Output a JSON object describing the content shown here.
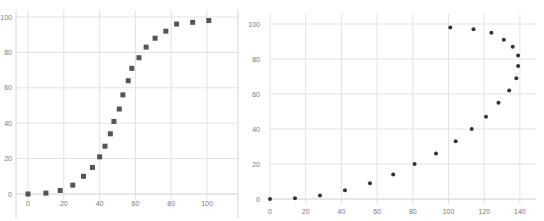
{
  "chart_data": [
    {
      "type": "scatter",
      "title": "",
      "xlabel": "",
      "ylabel": "",
      "xlim": [
        0,
        115
      ],
      "ylim": [
        0,
        105
      ],
      "x_ticks": [
        "0",
        "20",
        "40",
        "60",
        "80",
        "100"
      ],
      "y_ticks": [
        "0",
        "20",
        "40",
        "60",
        "80",
        "100"
      ],
      "grid": true,
      "legend": "none",
      "marker": "square",
      "marker_color": "#555555",
      "series": [
        {
          "name": "Series 1",
          "x": [
            0,
            10,
            18,
            25,
            31,
            36,
            40,
            43,
            46,
            48,
            51,
            53,
            56,
            58,
            62,
            66,
            71,
            77,
            83,
            92,
            101
          ],
          "y": [
            0,
            0.5,
            2,
            5,
            10,
            15,
            21,
            27,
            34,
            41,
            48,
            56,
            64,
            71,
            77,
            83,
            88,
            92,
            96,
            97,
            98
          ]
        }
      ]
    },
    {
      "type": "scatter",
      "title": "",
      "xlabel": "",
      "ylabel": "",
      "xlim": [
        0,
        148
      ],
      "ylim": [
        0,
        108
      ],
      "x_ticks": [
        "0",
        "20",
        "40",
        "60",
        "80",
        "100",
        "120",
        "140"
      ],
      "y_ticks": [
        "0",
        "20",
        "40",
        "60",
        "80",
        "100"
      ],
      "grid": true,
      "legend": "none",
      "marker": "circle",
      "marker_color": "#333333",
      "series": [
        {
          "name": "Series 1",
          "x": [
            0,
            14,
            28,
            42,
            56,
            69,
            81,
            93,
            104,
            113,
            121,
            128,
            134,
            138,
            139,
            139,
            136,
            131,
            124,
            114,
            101
          ],
          "y": [
            0,
            0.5,
            2,
            5,
            9,
            14,
            20,
            26,
            33,
            40,
            47,
            55,
            62,
            69,
            76,
            82,
            87,
            91,
            95,
            97,
            98
          ]
        }
      ]
    }
  ]
}
